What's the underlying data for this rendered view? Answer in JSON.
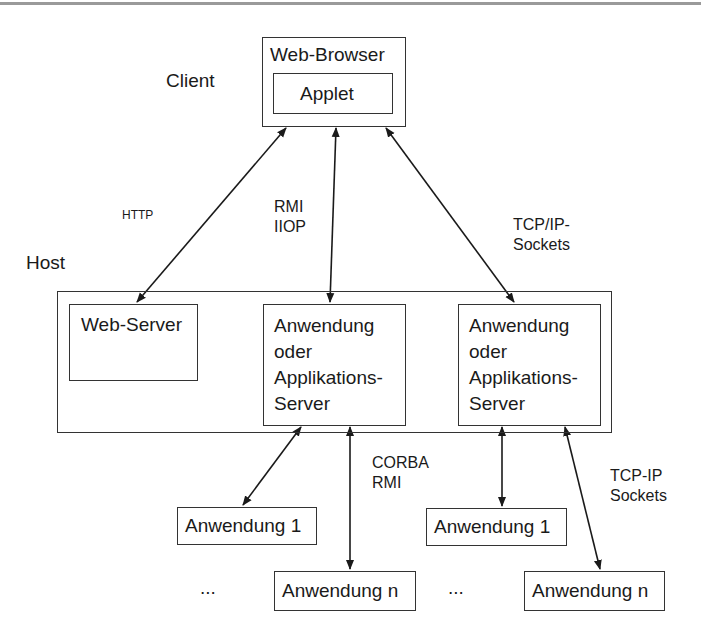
{
  "zones": {
    "client": "Client",
    "host": "Host"
  },
  "client": {
    "browser_label": "Web-Browser",
    "applet_label": "Applet"
  },
  "host": {
    "web_server": "Web-Server",
    "app_server_left": "Anwendung\noder\nApplikations-\nServer",
    "app_server_right": "Anwendung\noder\nApplikations-\nServer"
  },
  "backend": {
    "left": {
      "app_1": "Anwendung 1",
      "app_n": "Anwendung n",
      "ellipsis": "..."
    },
    "right": {
      "app_1": "Anwendung 1",
      "app_n": "Anwendung n",
      "ellipsis": "..."
    }
  },
  "protocols": {
    "http": "HTTP",
    "rmi_iiop": "RMI\nIIOP",
    "tcpip_sockets_top": "TCP/IP-\nSockets",
    "corba_rmi": "CORBA\nRMI",
    "tcpip_sockets_bottom": "TCP-IP\nSockets"
  },
  "colors": {
    "line": "#1a1a1a",
    "background": "#ffffff"
  }
}
